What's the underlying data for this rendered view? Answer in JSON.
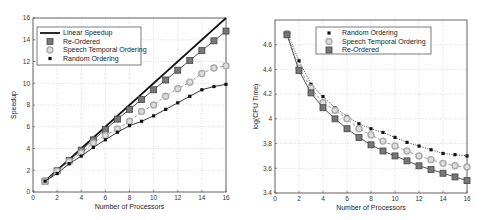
{
  "chart_data": [
    {
      "type": "line",
      "title": "",
      "xlabel": "Number of Processors",
      "ylabel": "Speedup",
      "xlim": [
        0,
        16
      ],
      "ylim": [
        0,
        16
      ],
      "xticks": [
        0,
        2,
        4,
        6,
        8,
        10,
        12,
        14,
        16
      ],
      "yticks": [
        0,
        2,
        4,
        6,
        8,
        10,
        12,
        14,
        16
      ],
      "grid": true,
      "legend_position": "upper left",
      "x": [
        1,
        2,
        3,
        4,
        5,
        6,
        7,
        8,
        9,
        10,
        11,
        12,
        13,
        14,
        15,
        16
      ],
      "series": [
        {
          "name": "Linear Speedup",
          "marker": "none",
          "style": "solid-thick",
          "values": [
            1,
            2,
            3,
            4,
            5,
            6,
            7,
            8,
            9,
            10,
            11,
            12,
            13,
            14,
            15,
            16
          ]
        },
        {
          "name": "Re-Ordered",
          "marker": "square",
          "style": "solid",
          "values": [
            1,
            1.95,
            2.9,
            3.85,
            4.8,
            5.75,
            6.7,
            7.6,
            8.5,
            9.4,
            10.3,
            11.2,
            12.1,
            13.0,
            13.9,
            14.8
          ]
        },
        {
          "name": "Speech Temporal Ordering",
          "marker": "circle",
          "style": "dashed",
          "values": [
            1,
            1.9,
            2.8,
            3.6,
            4.5,
            5.2,
            5.8,
            6.5,
            7.4,
            8.0,
            8.8,
            9.5,
            10.1,
            10.9,
            11.4,
            11.6
          ]
        },
        {
          "name": "Random Ordering",
          "marker": "dot",
          "style": "solid",
          "values": [
            1,
            1.7,
            2.6,
            3.3,
            4.1,
            4.8,
            5.5,
            6.1,
            6.5,
            7.0,
            7.6,
            8.2,
            8.8,
            9.4,
            9.7,
            9.9
          ]
        }
      ]
    },
    {
      "type": "line",
      "title": "",
      "xlabel": "Number of Processors",
      "ylabel": "log(CPU Time)",
      "xlim": [
        0,
        16
      ],
      "ylim": [
        3.4,
        4.8
      ],
      "xticks": [
        0,
        2,
        4,
        6,
        8,
        10,
        12,
        14,
        16
      ],
      "yticks": [
        3.4,
        3.6,
        3.8,
        4,
        4.2,
        4.4,
        4.6
      ],
      "ytick_labels": [
        "3.4",
        "3.6",
        "3.8",
        "4",
        "4.2",
        "4.4",
        "4.6"
      ],
      "grid": true,
      "legend_position": "upper right",
      "x": [
        1,
        2,
        3,
        4,
        5,
        6,
        7,
        8,
        9,
        10,
        11,
        12,
        13,
        14,
        15,
        16
      ],
      "series": [
        {
          "name": "Random Ordering",
          "marker": "dot",
          "style": "dotted",
          "values": [
            4.7,
            4.47,
            4.28,
            4.18,
            4.09,
            4.02,
            3.96,
            3.92,
            3.89,
            3.85,
            3.81,
            3.78,
            3.75,
            3.72,
            3.71,
            3.7
          ]
        },
        {
          "name": "Speech Temporal Ordering",
          "marker": "circle",
          "style": "dashed",
          "values": [
            4.69,
            4.41,
            4.25,
            4.13,
            4.07,
            4.0,
            3.92,
            3.87,
            3.82,
            3.78,
            3.74,
            3.7,
            3.67,
            3.64,
            3.62,
            3.61
          ]
        },
        {
          "name": "Re-Ordered",
          "marker": "square",
          "style": "solid",
          "values": [
            4.68,
            4.39,
            4.21,
            4.09,
            4.0,
            3.92,
            3.85,
            3.79,
            3.74,
            3.7,
            3.66,
            3.62,
            3.59,
            3.56,
            3.53,
            3.5
          ]
        }
      ]
    }
  ],
  "left_chart": {
    "xlabel": "Number of Processors",
    "ylabel": "Speedup",
    "legend": [
      "Linear Speedup",
      "Re-Ordered",
      "Speech Temporal Ordering",
      "Random Ordering"
    ]
  },
  "right_chart": {
    "xlabel": "Number of Processors",
    "ylabel": "log(CPU Time)",
    "legend": [
      "Random Ordering",
      "Speech Temporal Ordering",
      "Re-Ordered"
    ]
  }
}
